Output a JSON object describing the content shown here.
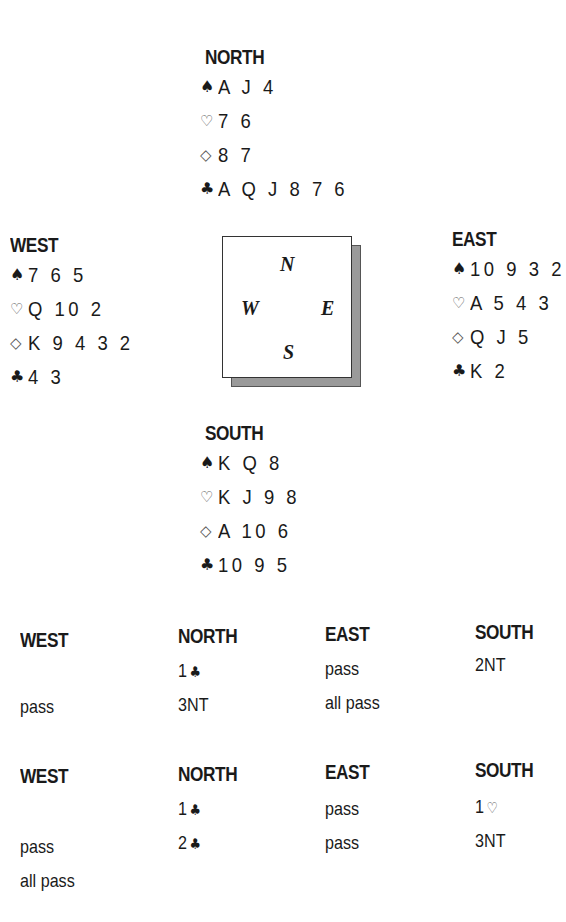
{
  "deal": {
    "north": {
      "title": "NORTH",
      "spades": "A J 4",
      "hearts": "7 6",
      "diamonds": "8 7",
      "clubs": "A Q J 8 7 6"
    },
    "west": {
      "title": "WEST",
      "spades": "7 6 5",
      "hearts": "Q 10 2",
      "diamonds": "K 9 4 3 2",
      "clubs": "4 3"
    },
    "east": {
      "title": "EAST",
      "spades": "10 9 3 2",
      "hearts": "A 5 4 3",
      "diamonds": "Q J 5",
      "clubs": "K 2"
    },
    "south": {
      "title": "SOUTH",
      "spades": "K Q 8",
      "hearts": "K J 9 8",
      "diamonds": "A 10 6",
      "clubs": "10 9 5"
    }
  },
  "suit_icons": {
    "spade": "♠",
    "heart": "♡",
    "diamond": "◇",
    "club": "♣"
  },
  "compass": {
    "n": "N",
    "w": "W",
    "e": "E",
    "s": "S"
  },
  "auction_1": {
    "headers": [
      "WEST",
      "NORTH",
      "EAST",
      "SOUTH"
    ],
    "rows": [
      {
        "west": "",
        "north_level": "1",
        "north_suit": "♣",
        "east": "pass",
        "south": "2NT"
      },
      {
        "west": "pass",
        "north": "3NT",
        "east": "all pass",
        "south": ""
      }
    ]
  },
  "auction_2": {
    "headers": [
      "WEST",
      "NORTH",
      "EAST",
      "SOUTH"
    ],
    "rows": [
      {
        "west": "",
        "north_level": "1",
        "north_suit": "♣",
        "east": "pass",
        "south_level": "1",
        "south_suit": "♡"
      },
      {
        "west": "pass",
        "north_level": "2",
        "north_suit": "♣",
        "east": "pass",
        "south": "3NT"
      },
      {
        "west": "all pass",
        "north": "",
        "east": "",
        "south": ""
      }
    ]
  }
}
